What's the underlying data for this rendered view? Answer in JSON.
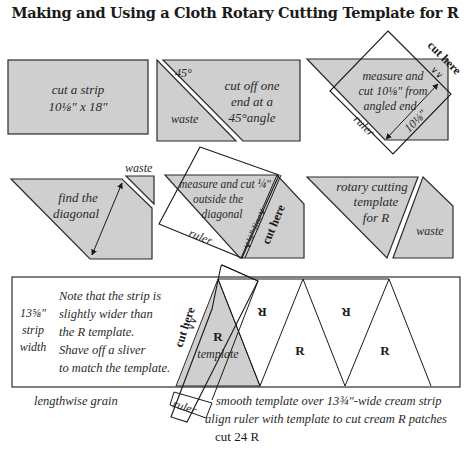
{
  "title": "Making and Using a Cloth Rotary Cutting Template for R",
  "colors": {
    "fabric_gray": "#cfcfcf",
    "outline": "#2b2b2b",
    "background": "#ffffff",
    "text": "#2a2a2a"
  },
  "steps": [
    {
      "id": "step1",
      "labels": [
        "cut a strip",
        "10⅛\" x 18\""
      ]
    },
    {
      "id": "step2",
      "angle_label": "45°",
      "waste_label": "waste",
      "labels": [
        "cut off one",
        "end at a",
        "45°angle"
      ]
    },
    {
      "id": "step3",
      "labels": [
        "measure and",
        "cut 10⅛\" from",
        "angled end"
      ],
      "ruler_label": "ruler",
      "measure_label": "10⅛\"",
      "cut_label": "cut here",
      "cut_marks": "∨∨"
    },
    {
      "id": "step4",
      "waste_label": "waste",
      "labels": [
        "find the",
        "diagonal"
      ]
    },
    {
      "id": "step5",
      "labels": [
        "measure and cut ¼\"",
        "outside the",
        "diagonal"
      ],
      "ruler_label": "ruler",
      "line_label": "∨¼\" line∨",
      "cut_label": "cut here",
      "cut_marks": "∧∧"
    },
    {
      "id": "step6",
      "labels": [
        "rotary cutting",
        "template",
        "for R"
      ],
      "waste_label": "waste"
    }
  ],
  "strip_panel": {
    "width_label": [
      "13⅝\"",
      "strip",
      "width"
    ],
    "note": [
      "Note that the strip is",
      "slightly wider than",
      "the R template.",
      "Shave off a sliver",
      "to match the template."
    ],
    "cut_label": "cut here",
    "cut_marks": "∨∨",
    "template_letter": "R",
    "template_label": "template",
    "patch_letters": [
      "R",
      "R",
      "R",
      "R"
    ],
    "ruler_label": "ruler",
    "grain_label": "lengthwise grain",
    "captions": [
      "smooth template over 13¾\"-wide cream strip",
      "align ruler with template to cut cream R patches"
    ],
    "count_label": "cut 24 R"
  }
}
